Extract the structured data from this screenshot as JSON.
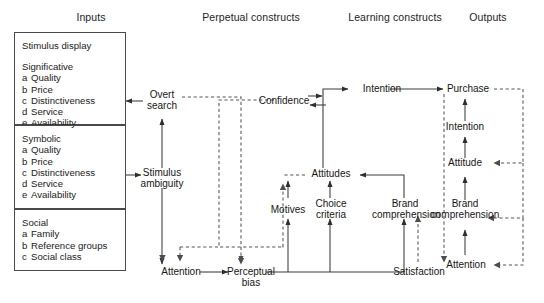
{
  "diagram": {
    "columns": [
      {
        "id": "inputs",
        "label": "Inputs"
      },
      {
        "id": "perpetual-constructs",
        "label": "Perpetual constructs"
      },
      {
        "id": "learning-constructs",
        "label": "Learning constructs"
      },
      {
        "id": "outputs",
        "label": "Outputs"
      }
    ],
    "input_boxes": [
      {
        "id": "stimulus-display",
        "title": "Stimulus display",
        "group": "Significative",
        "items": [
          {
            "key": "a",
            "text": "Quality"
          },
          {
            "key": "b",
            "text": "Price"
          },
          {
            "key": "c",
            "text": "Distinctiveness"
          },
          {
            "key": "d",
            "text": "Service"
          },
          {
            "key": "e",
            "text": "Availability"
          }
        ]
      },
      {
        "id": "symbolic",
        "title": "",
        "group": "Symbolic",
        "items": [
          {
            "key": "a",
            "text": "Quality"
          },
          {
            "key": "b",
            "text": "Price"
          },
          {
            "key": "c",
            "text": "Distinctiveness"
          },
          {
            "key": "d",
            "text": "Service"
          },
          {
            "key": "e",
            "text": "Availability"
          }
        ]
      },
      {
        "id": "social",
        "title": "",
        "group": "Social",
        "items": [
          {
            "key": "a",
            "text": "Family"
          },
          {
            "key": "b",
            "text": "Reference groups"
          },
          {
            "key": "c",
            "text": "Social class"
          }
        ]
      }
    ],
    "nodes": [
      {
        "id": "overt-search",
        "label": "Overt search",
        "column": "perpetual-constructs"
      },
      {
        "id": "stimulus-ambiguity",
        "label": "Stimulus ambiguity",
        "column": "perpetual-constructs"
      },
      {
        "id": "attention-perpetual",
        "label": "Attention",
        "column": "perpetual-constructs"
      },
      {
        "id": "perceptual-bias",
        "label": "Perceptual bias",
        "column": "perpetual-constructs"
      },
      {
        "id": "confidence",
        "label": "Confidence",
        "column": "perpetual-constructs"
      },
      {
        "id": "intention-learning",
        "label": "Intention",
        "column": "learning-constructs"
      },
      {
        "id": "attitudes",
        "label": "Attitudes",
        "column": "learning-constructs"
      },
      {
        "id": "motives",
        "label": "Motives",
        "column": "learning-constructs"
      },
      {
        "id": "choice-criteria",
        "label": "Choice criteria",
        "column": "learning-constructs"
      },
      {
        "id": "brand-comprehension-lc",
        "label": "Brand comprehension",
        "column": "learning-constructs"
      },
      {
        "id": "satisfaction",
        "label": "Satisfaction",
        "column": "learning-constructs"
      },
      {
        "id": "purchase",
        "label": "Purchase",
        "column": "outputs"
      },
      {
        "id": "intention-output",
        "label": "Intention",
        "column": "outputs"
      },
      {
        "id": "attitude-output",
        "label": "Attitude",
        "column": "outputs"
      },
      {
        "id": "brand-comprehension-out",
        "label": "Brand comprehension",
        "column": "outputs"
      },
      {
        "id": "attention-output",
        "label": "Attention",
        "column": "outputs"
      }
    ],
    "colors": {
      "line": "#3a3a3a",
      "box_border": "#4a4a4a",
      "text": "#1a1a1a",
      "background": "#ffffff"
    },
    "edges": [
      {
        "from": "overt-search",
        "to": "stimulus-display",
        "style": "solid"
      },
      {
        "from": "stimulus-ambiguity",
        "to": "overt-search",
        "style": "solid"
      },
      {
        "from": "symbolic",
        "to": "stimulus-ambiguity",
        "style": "solid"
      },
      {
        "from": "stimulus-ambiguity",
        "to": "attention-perpetual",
        "style": "solid"
      },
      {
        "from": "attention-perpetual",
        "to": "perceptual-bias",
        "style": "solid"
      },
      {
        "from": "overt-search",
        "to": "perceptual-bias",
        "style": "dashed"
      },
      {
        "from": "stimulus-ambiguity",
        "to": "attention-perpetual",
        "style": "dashed"
      },
      {
        "from": "confidence",
        "to": "stimulus-ambiguity",
        "style": "dashed"
      },
      {
        "from": "confidence",
        "to": "intention-learning",
        "style": "solid"
      },
      {
        "from": "intention-learning",
        "to": "confidence",
        "style": "solid"
      },
      {
        "from": "attitudes",
        "to": "confidence",
        "style": "dashed"
      },
      {
        "from": "attitudes",
        "to": "intention-learning",
        "style": "solid"
      },
      {
        "from": "motives",
        "to": "attitudes",
        "style": "solid"
      },
      {
        "from": "choice-criteria",
        "to": "attitudes",
        "style": "solid"
      },
      {
        "from": "brand-comprehension-lc",
        "to": "attitudes",
        "style": "solid"
      },
      {
        "from": "perceptual-bias",
        "to": "motives",
        "style": "solid"
      },
      {
        "from": "perceptual-bias",
        "to": "choice-criteria",
        "style": "solid"
      },
      {
        "from": "perceptual-bias",
        "to": "brand-comprehension-lc",
        "style": "solid"
      },
      {
        "from": "satisfaction",
        "to": "brand-comprehension-lc",
        "style": "dashed"
      },
      {
        "from": "intention-learning",
        "to": "purchase",
        "style": "solid"
      },
      {
        "from": "intention-output",
        "to": "purchase",
        "style": "solid"
      },
      {
        "from": "attitude-output",
        "to": "intention-output",
        "style": "solid"
      },
      {
        "from": "brand-comprehension-out",
        "to": "attitude-output",
        "style": "solid"
      },
      {
        "from": "attention-output",
        "to": "brand-comprehension-out",
        "style": "solid"
      },
      {
        "from": "purchase",
        "to": "satisfaction",
        "style": "dashed"
      },
      {
        "from": "purchase",
        "to": "attitude-output",
        "style": "dashed"
      },
      {
        "from": "purchase",
        "to": "brand-comprehension-out",
        "style": "dashed"
      },
      {
        "from": "purchase",
        "to": "attention-output",
        "style": "dashed"
      }
    ]
  }
}
